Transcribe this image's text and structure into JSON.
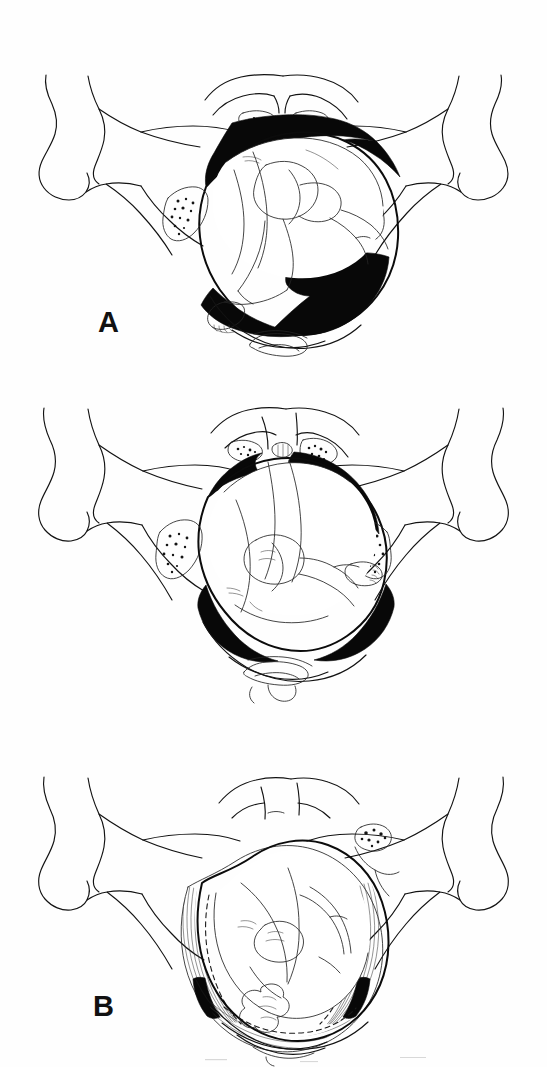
{
  "figure": {
    "kind": "medical-line-illustration",
    "background_color": "#ffffff",
    "ink_color": "#121212",
    "shading_color": "#080808",
    "panel_count": 3,
    "panels": [
      {
        "id": "A",
        "label": "A",
        "label_position": {
          "x": 98,
          "y": 308
        },
        "caption": "",
        "shading_style": "solid-black",
        "shaded_regions": [
          "upper pelvic brim crescent",
          "lower right sacral hollow"
        ],
        "structures": [
          "left ilium",
          "right ilium",
          "left anterior superior iliac spine",
          "right anterior superior iliac spine",
          "symphysis pubis",
          "left superior pubic ramus",
          "right superior pubic ramus",
          "left sacroiliac joint",
          "right sacroiliac joint",
          "sacrum",
          "coccyx",
          "fetal buttock",
          "fetal thigh",
          "fetal leg",
          "fetal foot with toes",
          "fetal trunk"
        ]
      },
      {
        "id": "B",
        "label": "B",
        "label_position": {
          "x": 93,
          "y": 632
        },
        "caption": "",
        "shading_style": "solid-black",
        "shaded_regions": [
          "upper right brim wedge",
          "upper left brim wedge",
          "lower left crescent",
          "lower right crescent"
        ],
        "structures": [
          "left ilium",
          "right ilium",
          "symphysis pubis",
          "pubic symphysis joint line",
          "left sacroiliac joint",
          "right sacroiliac joint",
          "sacrum",
          "coccyx",
          "fetal buttock",
          "fetal thigh",
          "fetal leg",
          "fetal foot with toes",
          "fetal trunk"
        ]
      },
      {
        "id": "C",
        "label": "C",
        "label_position": {
          "x": 84,
          "y": 995
        },
        "caption": "",
        "shading_style": "hatched-fibres",
        "shaded_regions": [
          "distended soft tissue ring",
          "levator muscle fibres",
          "perineal fibres"
        ],
        "structures": [
          "left ilium",
          "right ilium",
          "symphysis pubis",
          "right sacroiliac joint",
          "sacrum",
          "coccyx",
          "distended vaginal outlet",
          "levator ani muscle fibres",
          "fetal head",
          "fetal buttock",
          "fetal limb",
          "hidden outline dashes"
        ]
      }
    ]
  }
}
